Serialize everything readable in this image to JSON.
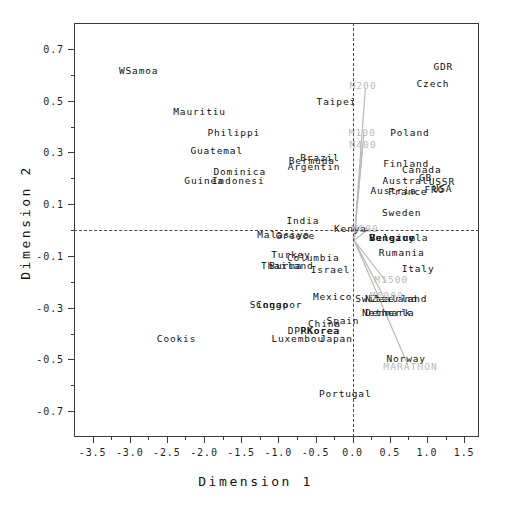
{
  "chart_data": {
    "type": "scatter",
    "title": "",
    "xlabel": "Dimension 1",
    "ylabel": "Dimension 2",
    "xlim": [
      -3.75,
      1.7
    ],
    "ylim": [
      -0.8,
      0.8
    ],
    "xticks": [
      -3.5,
      -3.0,
      -2.5,
      -2.0,
      -1.5,
      -1.0,
      -0.5,
      0.0,
      0.5,
      1.0,
      1.5
    ],
    "xticklabels": [
      "-3.5",
      "-3.0",
      "-2.5",
      "-2.0",
      "-1.5",
      "-1.0",
      "-0.5",
      "0.0",
      "0.5",
      "1.0",
      "1.5"
    ],
    "yticks": [
      0.7,
      0.5,
      0.3,
      0.1,
      -0.1,
      -0.3,
      -0.5,
      -0.7
    ],
    "yticklabels": [
      "0.7",
      "0.5",
      "0.3",
      "0.1",
      "-0.1",
      "-0.3",
      "-0.5",
      "-0.7"
    ],
    "xminor": [
      -3.25,
      -2.75,
      -2.25,
      -1.75,
      -1.25,
      -0.75,
      -0.25,
      0.25,
      0.75,
      1.25
    ],
    "yminor": [
      0.6,
      0.4,
      0.2,
      0.0,
      -0.2,
      -0.4,
      -0.6
    ],
    "grid": false,
    "legend": "none",
    "reference_lines": {
      "x": 0.0,
      "y": 0.0,
      "style": "dashed"
    },
    "colors": {
      "points": "#101010",
      "vectors": "#b9b9b9",
      "frame": "#3a3a3a"
    },
    "points": [
      {
        "label": "WSamoa",
        "x": -2.88,
        "y": 0.615
      },
      {
        "label": "Mauritiu",
        "x": -2.06,
        "y": 0.455
      },
      {
        "label": "Philippi",
        "x": -1.6,
        "y": 0.375
      },
      {
        "label": "Guatemal",
        "x": -1.83,
        "y": 0.305
      },
      {
        "label": "Dominica",
        "x": -1.52,
        "y": 0.225
      },
      {
        "label": "Guinea",
        "x": -2.0,
        "y": 0.19
      },
      {
        "label": "Indonesi",
        "x": -1.54,
        "y": 0.19
      },
      {
        "label": "Taipei",
        "x": -0.22,
        "y": 0.495
      },
      {
        "label": "Bermuda",
        "x": -0.55,
        "y": 0.265
      },
      {
        "label": "Brazil",
        "x": -0.44,
        "y": 0.28
      },
      {
        "label": "Argentin",
        "x": -0.52,
        "y": 0.245
      },
      {
        "label": "GDR",
        "x": 1.22,
        "y": 0.63
      },
      {
        "label": "Czech",
        "x": 1.08,
        "y": 0.565
      },
      {
        "label": "Poland",
        "x": 0.77,
        "y": 0.375
      },
      {
        "label": "Finland",
        "x": 0.72,
        "y": 0.255
      },
      {
        "label": "Canada",
        "x": 0.93,
        "y": 0.23
      },
      {
        "label": "Austral",
        "x": 0.71,
        "y": 0.19
      },
      {
        "label": "GB",
        "x": 0.98,
        "y": 0.2
      },
      {
        "label": "USSR",
        "x": 1.2,
        "y": 0.185
      },
      {
        "label": "FRG",
        "x": 1.1,
        "y": 0.155
      },
      {
        "label": "USA",
        "x": 1.21,
        "y": 0.16
      },
      {
        "label": "Austria",
        "x": 0.55,
        "y": 0.15
      },
      {
        "label": "France",
        "x": 0.74,
        "y": 0.145
      },
      {
        "label": "Sweden",
        "x": 0.66,
        "y": 0.065
      },
      {
        "label": "India",
        "x": -0.67,
        "y": 0.035
      },
      {
        "label": "Kenya",
        "x": -0.03,
        "y": 0.005
      },
      {
        "label": "Malasiya",
        "x": -0.93,
        "y": -0.02
      },
      {
        "label": "Greece",
        "x": -0.77,
        "y": -0.025
      },
      {
        "label": "Hungary",
        "x": 0.53,
        "y": -0.03
      },
      {
        "label": "Belgium",
        "x": 0.54,
        "y": -0.03
      },
      {
        "label": "Venezuela",
        "x": 0.62,
        "y": -0.03
      },
      {
        "label": "Rumania",
        "x": 0.66,
        "y": -0.09
      },
      {
        "label": "Turkey",
        "x": -0.83,
        "y": -0.095
      },
      {
        "label": "Columbia",
        "x": -0.53,
        "y": -0.11
      },
      {
        "label": "Thailand",
        "x": -0.88,
        "y": -0.14
      },
      {
        "label": "Burma",
        "x": -0.9,
        "y": -0.14
      },
      {
        "label": "Israel",
        "x": -0.3,
        "y": -0.155
      },
      {
        "label": "Italy",
        "x": 0.88,
        "y": -0.15
      },
      {
        "label": "Mexico",
        "x": -0.27,
        "y": -0.26
      },
      {
        "label": "Switzerland",
        "x": 0.52,
        "y": -0.265
      },
      {
        "label": "NZealand",
        "x": 0.52,
        "y": -0.265
      },
      {
        "label": "Congo",
        "x": -1.08,
        "y": -0.29
      },
      {
        "label": "Singapor",
        "x": -1.03,
        "y": -0.29
      },
      {
        "label": "Denmark",
        "x": 0.48,
        "y": -0.32
      },
      {
        "label": "Netherla",
        "x": 0.48,
        "y": -0.32
      },
      {
        "label": "Spain",
        "x": -0.13,
        "y": -0.35
      },
      {
        "label": "China",
        "x": -0.38,
        "y": -0.365
      },
      {
        "label": "DPRKorea",
        "x": -0.52,
        "y": -0.39
      },
      {
        "label": "PKorea",
        "x": -0.44,
        "y": -0.39
      },
      {
        "label": "Luxembou",
        "x": -0.74,
        "y": -0.42
      },
      {
        "label": "Japan",
        "x": -0.22,
        "y": -0.42
      },
      {
        "label": "Cookis",
        "x": -2.37,
        "y": -0.42
      },
      {
        "label": "Norway",
        "x": 0.72,
        "y": -0.5
      },
      {
        "label": "Portugal",
        "x": -0.1,
        "y": -0.635
      }
    ],
    "variable_vectors": [
      {
        "label": "M200",
        "x": 0.14,
        "y": 0.555
      },
      {
        "label": "M100",
        "x": 0.13,
        "y": 0.375
      },
      {
        "label": "M400",
        "x": 0.14,
        "y": 0.33
      },
      {
        "label": "M800",
        "x": 0.17,
        "y": 0.005
      },
      {
        "label": "M1500",
        "x": 0.52,
        "y": -0.195
      },
      {
        "label": "M5000",
        "x": 0.46,
        "y": -0.255
      },
      {
        "label": "MARATHON",
        "x": 0.78,
        "y": -0.53
      }
    ],
    "vector_lines": [
      {
        "name": "M200-line",
        "x1": 0.02,
        "y1": -0.04,
        "x2": 0.17,
        "y2": 0.545
      },
      {
        "name": "M100-line",
        "x1": 0.02,
        "y1": -0.04,
        "x2": 0.15,
        "y2": 0.37
      },
      {
        "name": "M400-line",
        "x1": 0.02,
        "y1": -0.04,
        "x2": 0.13,
        "y2": 0.318
      },
      {
        "name": "M800-line",
        "x1": 0.02,
        "y1": -0.04,
        "x2": 0.22,
        "y2": 0.005
      },
      {
        "name": "M1500-line",
        "x1": 0.02,
        "y1": -0.04,
        "x2": 0.45,
        "y2": -0.2
      },
      {
        "name": "M5000-line",
        "x1": 0.02,
        "y1": -0.04,
        "x2": 0.42,
        "y2": -0.26
      },
      {
        "name": "MARATHON-line",
        "x1": 0.02,
        "y1": -0.04,
        "x2": 0.74,
        "y2": -0.52
      }
    ]
  }
}
